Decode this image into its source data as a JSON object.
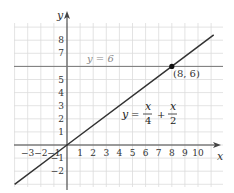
{
  "chart_data": {
    "type": "line",
    "title": "",
    "xlabel": "x",
    "ylabel": "y",
    "xlim": [
      -4,
      11.5
    ],
    "ylim": [
      -3.1,
      9.2
    ],
    "grid": true,
    "x_ticks": [
      "-3",
      "-2",
      "-1",
      "1",
      "2",
      "3",
      "4",
      "5",
      "6",
      "7",
      "8",
      "9",
      "10"
    ],
    "y_ticks": [
      "-2",
      "-1",
      "1",
      "2",
      "3",
      "4",
      "5",
      "7",
      "8"
    ],
    "series": [
      {
        "name": "y = x/4 + x/2",
        "equation": "y = 3x/4",
        "x": [
          -4,
          0,
          8,
          11.2
        ],
        "y": [
          -3,
          0,
          6,
          8.4
        ],
        "color": "#333333"
      },
      {
        "name": "y = 6",
        "equation": "y = 6",
        "x": [
          -4,
          11.5
        ],
        "y": [
          6,
          6
        ],
        "color": "#777777"
      }
    ],
    "annotations": [
      {
        "text": "y = 6",
        "x": 5.2,
        "y": 6.3
      },
      {
        "text": "(8, 6)",
        "x": 8.1,
        "y": 5.3,
        "point": [
          8,
          6
        ]
      },
      {
        "text": "y = x/4 + x/2",
        "x": 4.2,
        "y": 2.3
      }
    ]
  },
  "labels": {
    "x_axis": "x",
    "y_axis": "y",
    "hline_label": "y = 6",
    "point_label": "(8, 6)",
    "eq_y": "y",
    "eq_equals": "=",
    "eq_plus": "+",
    "eq_frac1_num": "x",
    "eq_frac1_den": "4",
    "eq_frac2_num": "x",
    "eq_frac2_den": "2"
  }
}
